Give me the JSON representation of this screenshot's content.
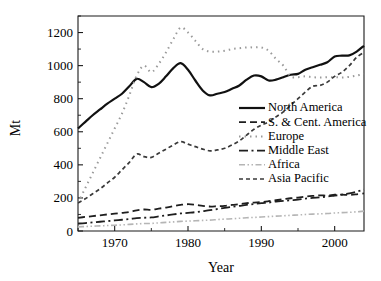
{
  "chart_data": {
    "type": "line",
    "title": "",
    "xlabel": "Year",
    "ylabel": "Mt",
    "xlim": [
      1965,
      2004
    ],
    "ylim": [
      0,
      1300
    ],
    "yticks": [
      0,
      200,
      400,
      600,
      800,
      1000,
      1200
    ],
    "ytick_labels": [
      "0",
      "200",
      "400",
      "600",
      "800",
      "1000",
      "1200"
    ],
    "xticks": [
      1970,
      1980,
      1990,
      2000
    ],
    "xtick_labels": [
      "1970",
      "1980",
      "1990",
      "2000"
    ],
    "xminor_ticks": [
      1965,
      1975,
      1985,
      1995
    ],
    "yminor_ticks": [
      100,
      300,
      500,
      700,
      900,
      1100,
      1300
    ],
    "grid": false,
    "legend_position": "center-right",
    "x": [
      1965,
      1966,
      1967,
      1968,
      1969,
      1970,
      1971,
      1972,
      1973,
      1974,
      1975,
      1976,
      1977,
      1978,
      1979,
      1980,
      1981,
      1982,
      1983,
      1984,
      1985,
      1986,
      1987,
      1988,
      1989,
      1990,
      1991,
      1992,
      1993,
      1994,
      1995,
      1996,
      1997,
      1998,
      1999,
      2000,
      2001,
      2002,
      2003,
      2004
    ],
    "series": [
      {
        "name": "North America",
        "style": "solid",
        "color": "#111111",
        "width": 2.2,
        "dash": "none",
        "values": [
          620,
          660,
          700,
          735,
          770,
          800,
          830,
          875,
          920,
          900,
          870,
          890,
          935,
          985,
          1015,
          975,
          910,
          850,
          820,
          830,
          840,
          860,
          880,
          915,
          940,
          935,
          910,
          915,
          930,
          945,
          950,
          975,
          990,
          1005,
          1020,
          1055,
          1060,
          1062,
          1085,
          1120
        ]
      },
      {
        "name": "S. & Cent. America",
        "style": "long-dash",
        "color": "#1e1e1e",
        "width": 1.8,
        "dash": "7,4",
        "values": [
          80,
          85,
          90,
          95,
          100,
          105,
          110,
          115,
          125,
          130,
          128,
          135,
          142,
          150,
          158,
          162,
          158,
          152,
          148,
          150,
          152,
          158,
          162,
          168,
          172,
          175,
          180,
          186,
          192,
          198,
          202,
          208,
          212,
          216,
          214,
          220,
          220,
          218,
          222,
          228
        ]
      },
      {
        "name": "Europe",
        "style": "dotted",
        "color": "#9a9a9a",
        "width": 2.0,
        "dash": "1.5,4",
        "values": [
          170,
          260,
          350,
          440,
          530,
          620,
          710,
          820,
          940,
          1000,
          960,
          1010,
          1080,
          1160,
          1230,
          1200,
          1150,
          1100,
          1085,
          1085,
          1090,
          1100,
          1105,
          1110,
          1110,
          1110,
          1090,
          1040,
          1000,
          935,
          930,
          935,
          930,
          928,
          930,
          930,
          928,
          932,
          940,
          950
        ]
      },
      {
        "name": "Middle East",
        "style": "dash-dot",
        "color": "#1e1e1e",
        "width": 1.8,
        "dash": "9,3.5,2,3.5",
        "values": [
          45,
          48,
          52,
          56,
          60,
          64,
          68,
          72,
          78,
          80,
          82,
          88,
          94,
          100,
          106,
          110,
          114,
          120,
          126,
          133,
          140,
          146,
          152,
          158,
          163,
          168,
          172,
          178,
          182,
          186,
          190,
          196,
          200,
          204,
          208,
          214,
          220,
          228,
          238,
          250
        ]
      },
      {
        "name": "Africa",
        "style": "dash-dot-dot",
        "color": "#b5b5b5",
        "width": 1.6,
        "dash": "6,2.5,1.5,2.5,1.5,2.5",
        "values": [
          25,
          27,
          29,
          31,
          33,
          35,
          37,
          40,
          43,
          45,
          46,
          49,
          52,
          55,
          58,
          60,
          62,
          64,
          66,
          69,
          72,
          74,
          77,
          80,
          82,
          85,
          87,
          90,
          92,
          95,
          97,
          100,
          102,
          104,
          106,
          109,
          111,
          113,
          116,
          120
        ]
      },
      {
        "name": "Asia Pacific",
        "style": "short-dash",
        "color": "#3a3a3a",
        "width": 1.7,
        "dash": "4,3",
        "values": [
          170,
          195,
          225,
          255,
          290,
          325,
          370,
          415,
          465,
          450,
          445,
          470,
          495,
          520,
          540,
          525,
          510,
          495,
          485,
          490,
          500,
          520,
          545,
          580,
          615,
          640,
          660,
          690,
          720,
          760,
          800,
          840,
          875,
          880,
          900,
          935,
          960,
          1000,
          1050,
          1080
        ]
      }
    ]
  },
  "legend": {
    "entries": [
      {
        "label": "North America"
      },
      {
        "label": "S. & Cent. America"
      },
      {
        "label": "Europe"
      },
      {
        "label": "Middle East"
      },
      {
        "label": "Africa"
      },
      {
        "label": "Asia Pacific"
      }
    ]
  }
}
